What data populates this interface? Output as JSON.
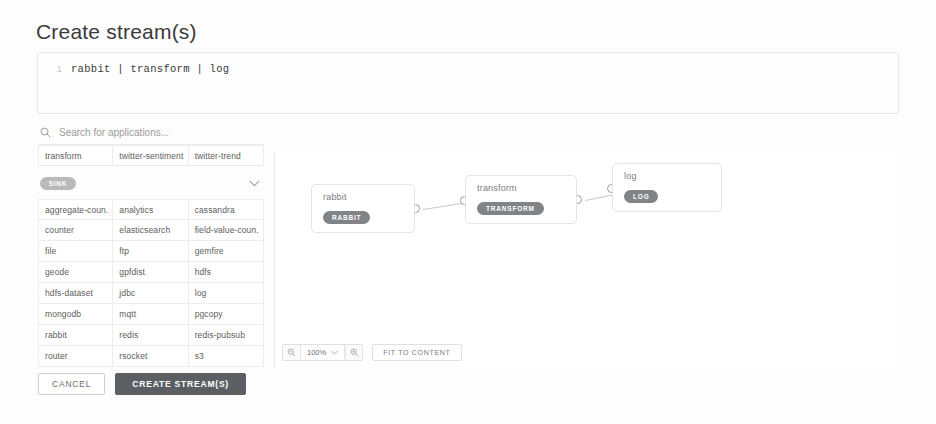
{
  "page": {
    "title": "Create stream(s)"
  },
  "editor": {
    "line_number": "1",
    "code": "rabbit | transform | log",
    "icon": "code-editor"
  },
  "palette": {
    "search": {
      "placeholder": "Search for applications...",
      "value": "",
      "icon": "search-icon"
    },
    "visible_apps_row": [
      "transform",
      "twitter-sentiment",
      "twitter-trend"
    ],
    "group": {
      "badge": "SINK",
      "chevron_icon": "chevron-down-icon"
    },
    "apps": [
      "aggregate-coun.",
      "analytics",
      "cassandra",
      "counter",
      "elasticsearch",
      "field-value-coun.",
      "file",
      "ftp",
      "gemfire",
      "geode",
      "gpfdist",
      "hdfs",
      "hdfs-dataset",
      "jdbc",
      "log",
      "mongodb",
      "mqtt",
      "pgcopy",
      "rabbit",
      "redis",
      "redis-pubsub",
      "router",
      "rsocket",
      "s3"
    ]
  },
  "actions": {
    "cancel_label": "CANCEL",
    "create_label": "CREATE STREAM(S)",
    "primary_color": "#5b5f63"
  },
  "canvas": {
    "nodes": [
      {
        "title": "rabbit",
        "badge": "RABBIT"
      },
      {
        "title": "transform",
        "badge": "TRANSFORM"
      },
      {
        "title": "log",
        "badge": "LOG"
      }
    ],
    "toolbar": {
      "zoom_out_icon": "zoom-out-icon",
      "zoom_level": "100%",
      "zoom_dropdown_icon": "chevron-down-icon",
      "zoom_in_icon": "zoom-in-icon",
      "fit_label": "FIT TO CONTENT"
    }
  }
}
